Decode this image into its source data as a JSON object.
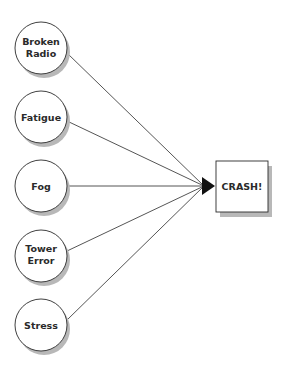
{
  "diagram": {
    "type": "cause-effect",
    "causes": [
      {
        "id": "broken-radio",
        "lines": [
          "Broken",
          "Radio"
        ],
        "cx": 41,
        "cy": 48
      },
      {
        "id": "fatigue",
        "lines": [
          "Fatigue"
        ],
        "cx": 41,
        "cy": 117
      },
      {
        "id": "fog",
        "lines": [
          "Fog"
        ],
        "cx": 41,
        "cy": 186
      },
      {
        "id": "tower-error",
        "lines": [
          "Tower",
          "Error"
        ],
        "cx": 41,
        "cy": 256
      },
      {
        "id": "stress",
        "lines": [
          "Stress"
        ],
        "cx": 41,
        "cy": 325
      }
    ],
    "effect": {
      "label": "CRASH!",
      "x": 216,
      "y": 161,
      "w": 52,
      "h": 51
    },
    "arrow_tip": {
      "x": 215,
      "y": 186
    },
    "colors": {
      "stroke": "#2a2a2a",
      "shadow": "#b8b8b8",
      "fill": "#ffffff",
      "text": "#2a2a2a"
    }
  }
}
